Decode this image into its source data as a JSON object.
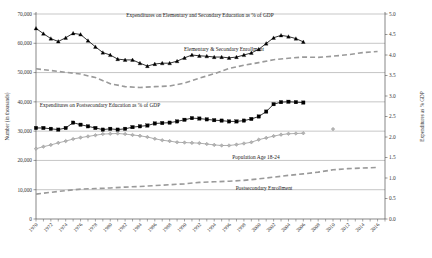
{
  "chart_data": {
    "type": "line",
    "title": "",
    "xlabel": "",
    "ylabel": "Number (in thousands)",
    "y2label": "Expenditures as % GDP",
    "grid": true,
    "legend_position": "inline-annotations",
    "xlim": [
      1970,
      2017
    ],
    "ylim": [
      0,
      70000
    ],
    "y2lim": [
      0.0,
      5.0
    ],
    "yticks": [
      "0",
      "10,000",
      "20,000",
      "30,000",
      "40,000",
      "50,000",
      "60,000",
      "70,000"
    ],
    "ytick_values": [
      0,
      10000,
      20000,
      30000,
      40000,
      50000,
      60000,
      70000
    ],
    "y2ticks": [
      "0.0",
      "0.5",
      "1.0",
      "1.5",
      "2.0",
      "2.5",
      "3.0",
      "3.5",
      "4.0",
      "4.5",
      "5.0"
    ],
    "y2tick_values": [
      0.0,
      0.5,
      1.0,
      1.5,
      2.0,
      2.5,
      3.0,
      3.5,
      4.0,
      4.5,
      5.0
    ],
    "xtick_labels": [
      "1970",
      "1972",
      "1974",
      "1976",
      "1978",
      "1980",
      "1982",
      "1984",
      "1986",
      "1988",
      "1990",
      "1992",
      "1994",
      "1996",
      "1998",
      "2000",
      "2002",
      "2004",
      "2006",
      "2008",
      "2010",
      "2012",
      "2014",
      "2016"
    ],
    "xtick_values": [
      1970,
      1972,
      1974,
      1976,
      1978,
      1980,
      1982,
      1984,
      1986,
      1988,
      1990,
      1992,
      1994,
      1996,
      1998,
      2000,
      2002,
      2004,
      2006,
      2008,
      2010,
      2012,
      2014,
      2016
    ],
    "series": [
      {
        "name": "Expenditures on Elementary and Secondary Education as % of GDP",
        "axis": "right",
        "marker": "triangle",
        "color": "#000000",
        "style": "solid",
        "x": [
          1970,
          1971,
          1972,
          1973,
          1974,
          1975,
          1976,
          1977,
          1978,
          1979,
          1980,
          1981,
          1982,
          1983,
          1984,
          1985,
          1986,
          1987,
          1988,
          1989,
          1990,
          1991,
          1992,
          1993,
          1994,
          1995,
          1996,
          1997,
          1998,
          1999,
          2000,
          2001,
          2002,
          2003,
          2004,
          2005,
          2006
        ],
        "values": [
          4.65,
          4.52,
          4.4,
          4.33,
          4.42,
          4.53,
          4.5,
          4.35,
          4.2,
          4.06,
          4.0,
          3.9,
          3.88,
          3.88,
          3.8,
          3.73,
          3.78,
          3.8,
          3.8,
          3.85,
          3.93,
          4.0,
          3.98,
          3.97,
          3.95,
          3.95,
          3.93,
          3.95,
          4.0,
          4.05,
          4.14,
          4.28,
          4.42,
          4.48,
          4.45,
          4.4,
          4.32
        ]
      },
      {
        "name": "Expenditures on Postsecondary Education as % of GDP",
        "axis": "right",
        "marker": "square",
        "color": "#000000",
        "style": "solid",
        "x": [
          1970,
          1971,
          1972,
          1973,
          1974,
          1975,
          1976,
          1977,
          1978,
          1979,
          1980,
          1981,
          1982,
          1983,
          1984,
          1985,
          1986,
          1987,
          1988,
          1989,
          1990,
          1991,
          1992,
          1993,
          1994,
          1995,
          1996,
          1997,
          1998,
          1999,
          2000,
          2001,
          2002,
          2003,
          2004,
          2005,
          2006
        ],
        "values": [
          2.22,
          2.22,
          2.2,
          2.18,
          2.22,
          2.35,
          2.3,
          2.26,
          2.22,
          2.18,
          2.2,
          2.18,
          2.2,
          2.24,
          2.26,
          2.28,
          2.33,
          2.34,
          2.35,
          2.38,
          2.42,
          2.46,
          2.45,
          2.43,
          2.41,
          2.4,
          2.38,
          2.38,
          2.4,
          2.44,
          2.5,
          2.62,
          2.8,
          2.85,
          2.86,
          2.85,
          2.84
        ]
      },
      {
        "name": "Elementary & Secondary Enrollment",
        "axis": "left",
        "marker": "none",
        "color": "#9a9a9a",
        "style": "dashed",
        "x": [
          1970,
          1972,
          1974,
          1976,
          1978,
          1980,
          1982,
          1984,
          1986,
          1988,
          1990,
          1992,
          1994,
          1996,
          1998,
          2000,
          2002,
          2004,
          2006,
          2008,
          2010,
          2012,
          2014,
          2016
        ],
        "values": [
          51300,
          50700,
          50100,
          49500,
          48300,
          46200,
          45200,
          44900,
          45200,
          45400,
          46400,
          48100,
          49600,
          51400,
          52500,
          53400,
          54400,
          54900,
          55300,
          55200,
          55600,
          56100,
          56800,
          57200
        ]
      },
      {
        "name": "Population Age 18-24",
        "axis": "left",
        "marker": "diamond",
        "color": "#9a9a9a",
        "style": "solid",
        "x": [
          1970,
          1971,
          1972,
          1973,
          1974,
          1975,
          1976,
          1977,
          1978,
          1979,
          1980,
          1981,
          1982,
          1983,
          1984,
          1985,
          1986,
          1987,
          1988,
          1989,
          1990,
          1991,
          1992,
          1993,
          1994,
          1995,
          1996,
          1997,
          1998,
          1999,
          2000,
          2001,
          2002,
          2003,
          2004,
          2005,
          2006,
          2010
        ],
        "values": [
          24000,
          24700,
          25300,
          26000,
          26600,
          27300,
          27800,
          28200,
          28600,
          29000,
          29100,
          29200,
          29000,
          28700,
          28400,
          28000,
          27400,
          26900,
          26600,
          26200,
          26100,
          26000,
          25900,
          25600,
          25300,
          25100,
          25100,
          25400,
          25800,
          26200,
          27100,
          27700,
          28300,
          28800,
          29100,
          29200,
          29300,
          30700
        ]
      },
      {
        "name": "Postsecondary Enrollment",
        "axis": "left",
        "marker": "none",
        "color": "#9a9a9a",
        "style": "dashed",
        "x": [
          1970,
          1972,
          1974,
          1976,
          1978,
          1980,
          1982,
          1984,
          1986,
          1988,
          1990,
          1992,
          1994,
          1996,
          1998,
          2000,
          2002,
          2004,
          2006,
          2008,
          2010,
          2012,
          2014,
          2016
        ],
        "values": [
          8500,
          9100,
          9700,
          10200,
          10400,
          10600,
          10900,
          11100,
          11400,
          11700,
          12000,
          12500,
          12700,
          12900,
          13200,
          13700,
          14300,
          14900,
          15400,
          16000,
          16800,
          17200,
          17400,
          17600
        ]
      }
    ],
    "annotations": [
      {
        "text": "Expenditures on Elementary and Secondary Education as % of GDP",
        "x": 200,
        "y": 17
      },
      {
        "text": "Elementary & Secondary Enrollment",
        "x": 224,
        "y": 51
      },
      {
        "text": "Expenditures on Postsecondary Education as % of GDP",
        "x": 100,
        "y": 107
      },
      {
        "text": "Population Age 18-24",
        "x": 256,
        "y": 159
      },
      {
        "text": "Postsecondary Enrollment",
        "x": 264,
        "y": 190
      }
    ]
  }
}
